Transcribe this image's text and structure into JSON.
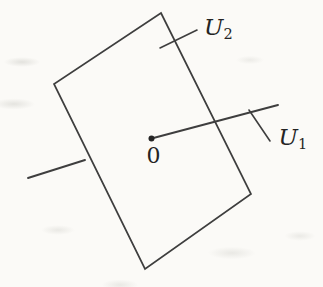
{
  "figure": {
    "labels": {
      "origin": "0",
      "u1": {
        "base": "U",
        "sub": "1"
      },
      "u2": {
        "base": "U",
        "sub": "2"
      }
    },
    "colors": {
      "ink": "#3e3e3e",
      "text": "#242424",
      "background": "#fbfaf7"
    }
  }
}
